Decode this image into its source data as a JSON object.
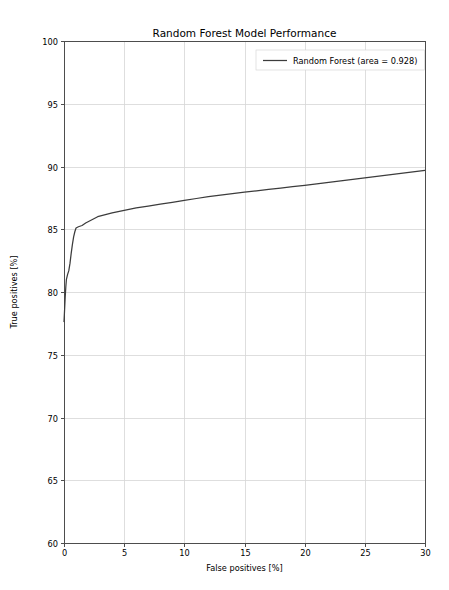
{
  "figure": {
    "width": 449,
    "height": 590,
    "background": "#ffffff",
    "plot_area": {
      "left": 64,
      "top": 41,
      "right": 425,
      "bottom": 543
    }
  },
  "chart_data": {
    "type": "line",
    "title": "Random Forest Model Performance",
    "xlabel": "False positives [%]",
    "ylabel": "True positives [%]",
    "xlim": [
      0,
      30
    ],
    "ylim": [
      60,
      100
    ],
    "xticks": [
      0,
      5,
      10,
      15,
      20,
      25,
      30
    ],
    "yticks": [
      60,
      65,
      70,
      75,
      80,
      85,
      90,
      95,
      100
    ],
    "xtick_labels": [
      "0",
      "5",
      "10",
      "15",
      "20",
      "25",
      "30"
    ],
    "ytick_labels": [
      "60",
      "65",
      "70",
      "75",
      "80",
      "85",
      "90",
      "95",
      "100"
    ],
    "grid": true,
    "grid_color": "#d6d6d6",
    "legend_position": "upper right",
    "series": [
      {
        "name": "Random Forest (area = 0.928)",
        "color": "#3c3c3c",
        "linewidth": 1.25,
        "area": 0.928,
        "x": [
          0.0,
          0.05,
          0.1,
          0.15,
          0.2,
          0.3,
          0.4,
          0.5,
          0.6,
          0.7,
          0.8,
          0.9,
          1.0,
          1.2,
          1.5,
          1.8,
          2.0,
          2.4,
          2.8,
          3.2,
          3.6,
          4.0,
          4.5,
          5.0,
          6.0,
          7.0,
          8.0,
          9.0,
          10.0,
          11.0,
          12.0,
          13.0,
          14.0,
          15.0,
          16.0,
          17.0,
          18.0,
          19.0,
          20.0,
          21.0,
          22.0,
          23.0,
          24.0,
          25.0,
          26.0,
          27.0,
          28.0,
          29.0,
          30.0
        ],
        "y": [
          77.6,
          78.6,
          79.6,
          80.4,
          81.0,
          81.4,
          81.7,
          82.3,
          83.1,
          83.8,
          84.4,
          84.8,
          85.1,
          85.2,
          85.3,
          85.5,
          85.6,
          85.8,
          86.0,
          86.1,
          86.2,
          86.3,
          86.4,
          86.5,
          86.7,
          86.85,
          87.0,
          87.15,
          87.3,
          87.45,
          87.6,
          87.72,
          87.84,
          87.95,
          88.06,
          88.17,
          88.28,
          88.4,
          88.5,
          88.62,
          88.74,
          88.86,
          88.98,
          89.1,
          89.22,
          89.34,
          89.46,
          89.58,
          89.7
        ]
      }
    ]
  },
  "legend": {
    "entries": [
      {
        "label": "Random Forest (area = 0.928)",
        "color": "#3c3c3c"
      }
    ]
  }
}
